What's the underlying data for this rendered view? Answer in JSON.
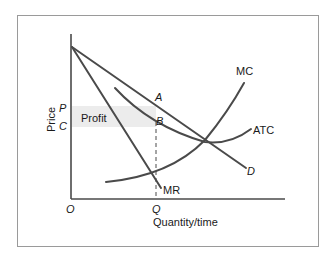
{
  "diagram": {
    "axes": {
      "y_label": "Price",
      "x_label": "Quantity/time",
      "origin_label": "O"
    },
    "price_ticks": {
      "p": "P",
      "c": "C"
    },
    "quantity_ticks": {
      "q": "Q"
    },
    "curves": {
      "mc": "MC",
      "atc": "ATC",
      "demand": "D",
      "mr": "MR"
    },
    "points": {
      "a": "A",
      "b": "B"
    },
    "regions": {
      "profit": "Profit"
    },
    "colors": {
      "curve": "#4a4a4a",
      "frame": "#9a9a9a",
      "profit_fill": "#ececec",
      "text": "#1a1a1a"
    }
  }
}
